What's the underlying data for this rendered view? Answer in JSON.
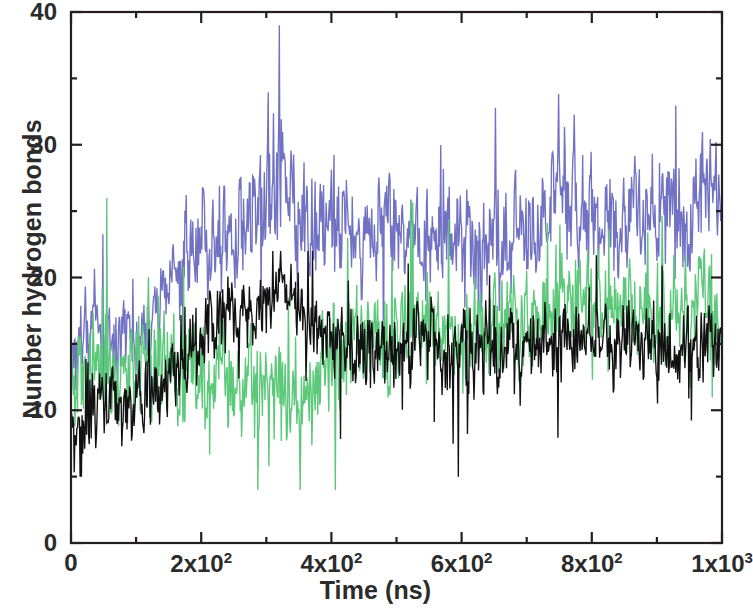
{
  "chart_data": {
    "type": "line",
    "title": "",
    "subtitle": "",
    "xlabel": "Time (ns)",
    "ylabel": "Number hydrogen bonds",
    "xlim": [
      0,
      1000
    ],
    "ylim": [
      0,
      40
    ],
    "grid": false,
    "legend_position": "none",
    "x_major_ticks": [
      0,
      200,
      400,
      600,
      800,
      1000
    ],
    "x_minor_ticks": [
      100,
      300,
      500,
      700,
      900
    ],
    "x_tick_labels": [
      "0",
      "2x10²",
      "4x10²",
      "6x10²",
      "8x10²",
      "1x10³"
    ],
    "x_tick_labels_parts": [
      {
        "mantissa": "0",
        "exp": ""
      },
      {
        "mantissa": "2x10",
        "exp": "2"
      },
      {
        "mantissa": "4x10",
        "exp": "2"
      },
      {
        "mantissa": "6x10",
        "exp": "2"
      },
      {
        "mantissa": "8x10",
        "exp": "2"
      },
      {
        "mantissa": "1x10",
        "exp": "3"
      }
    ],
    "y_major_ticks": [
      0,
      10,
      20,
      30,
      40
    ],
    "y_minor_ticks": [
      5,
      15,
      25,
      35
    ],
    "y_tick_labels": [
      "0",
      "10",
      "20",
      "30",
      "40"
    ],
    "axis_color": "#231f20",
    "background": "#ffffff",
    "sampling_interval_ns": 1,
    "series": [
      {
        "name": "series-blue",
        "color": "#7272c4",
        "draw_order": 1,
        "mean_profile_x": [
          0,
          25,
          50,
          75,
          100,
          125,
          150,
          175,
          200,
          225,
          250,
          275,
          300,
          320,
          340,
          360,
          380,
          400,
          425,
          450,
          475,
          500,
          525,
          550,
          575,
          600,
          625,
          650,
          675,
          700,
          725,
          750,
          775,
          800,
          825,
          850,
          875,
          900,
          925,
          950,
          975,
          1000
        ],
        "mean_profile_y": [
          14.0,
          15.5,
          16.0,
          15.0,
          14.5,
          16.5,
          19.5,
          21.5,
          22.5,
          23.0,
          23.5,
          25.0,
          26.0,
          27.0,
          25.5,
          24.5,
          24.0,
          24.5,
          24.0,
          23.5,
          24.0,
          24.5,
          24.0,
          23.0,
          23.5,
          22.5,
          22.0,
          22.5,
          23.0,
          24.0,
          25.5,
          26.5,
          25.5,
          24.5,
          24.0,
          24.5,
          25.0,
          25.5,
          25.0,
          24.5,
          25.0,
          25.5
        ],
        "band_halfwidth": [
          4.5,
          4.5,
          4.0,
          4.0,
          4.0,
          4.0,
          4.0,
          4.0,
          3.8,
          3.8,
          3.8,
          4.5,
          4.5,
          5.5,
          4.2,
          4.0,
          4.0,
          4.0,
          4.0,
          4.0,
          4.0,
          4.0,
          4.0,
          3.8,
          3.8,
          3.8,
          3.8,
          4.0,
          4.0,
          4.0,
          4.2,
          4.5,
          4.2,
          4.0,
          4.0,
          4.0,
          4.0,
          4.2,
          4.0,
          4.0,
          4.0,
          4.0
        ],
        "observed_min": 7,
        "observed_max": 39,
        "peak_value": 39,
        "peak_time": 320
      },
      {
        "name": "series-green",
        "color": "#5bc87a",
        "draw_order": 2,
        "mean_profile_x": [
          0,
          25,
          50,
          75,
          100,
          125,
          150,
          175,
          200,
          225,
          250,
          275,
          300,
          320,
          340,
          360,
          380,
          400,
          425,
          450,
          475,
          500,
          525,
          550,
          575,
          600,
          625,
          650,
          675,
          700,
          725,
          750,
          775,
          800,
          825,
          850,
          875,
          900,
          925,
          950,
          975,
          1000
        ],
        "mean_profile_y": [
          11.0,
          12.5,
          13.5,
          13.0,
          13.5,
          14.5,
          14.0,
          13.0,
          12.5,
          12.0,
          11.5,
          11.5,
          11.0,
          11.5,
          11.5,
          12.0,
          13.0,
          14.5,
          15.0,
          15.5,
          15.5,
          16.0,
          16.5,
          16.0,
          15.5,
          15.5,
          15.5,
          16.0,
          16.0,
          16.5,
          17.0,
          17.5,
          18.0,
          17.5,
          17.0,
          17.5,
          18.0,
          18.0,
          17.5,
          17.5,
          18.0,
          17.5
        ],
        "band_halfwidth": [
          4.0,
          4.0,
          4.0,
          4.0,
          4.0,
          4.5,
          4.0,
          4.0,
          4.0,
          4.0,
          3.8,
          3.8,
          3.8,
          4.0,
          4.0,
          4.0,
          4.0,
          4.0,
          3.8,
          3.8,
          3.8,
          3.8,
          3.8,
          3.8,
          3.8,
          3.8,
          3.8,
          3.8,
          3.8,
          3.8,
          4.0,
          4.2,
          4.2,
          4.0,
          4.0,
          4.0,
          4.2,
          4.0,
          4.0,
          4.0,
          4.2,
          4.0
        ],
        "observed_min": 4,
        "observed_max": 26,
        "peak_value": 26,
        "peak_time": 55
      },
      {
        "name": "series-black",
        "color": "#111111",
        "draw_order": 3,
        "mean_profile_x": [
          0,
          25,
          50,
          75,
          100,
          125,
          150,
          175,
          200,
          225,
          250,
          275,
          300,
          320,
          340,
          360,
          380,
          400,
          425,
          450,
          475,
          500,
          525,
          550,
          575,
          600,
          625,
          650,
          675,
          700,
          725,
          750,
          775,
          800,
          825,
          850,
          875,
          900,
          925,
          950,
          975,
          1000
        ],
        "mean_profile_y": [
          8.5,
          9.0,
          9.5,
          10.0,
          10.5,
          11.0,
          12.0,
          13.5,
          15.0,
          16.5,
          17.5,
          18.0,
          18.5,
          19.0,
          18.5,
          17.5,
          16.0,
          15.0,
          14.5,
          14.5,
          14.5,
          15.0,
          15.5,
          15.0,
          14.5,
          14.5,
          14.5,
          14.5,
          14.5,
          15.0,
          15.0,
          15.0,
          15.0,
          15.0,
          14.5,
          15.0,
          15.0,
          15.0,
          15.0,
          15.0,
          15.0,
          14.5
        ],
        "band_halfwidth": [
          3.0,
          3.0,
          3.0,
          3.0,
          3.0,
          3.2,
          3.2,
          3.2,
          3.0,
          2.8,
          2.5,
          2.5,
          2.5,
          2.5,
          2.5,
          2.8,
          3.0,
          3.0,
          3.0,
          3.0,
          3.0,
          3.0,
          3.0,
          3.0,
          3.0,
          3.0,
          3.0,
          3.0,
          3.0,
          3.0,
          3.0,
          3.0,
          3.0,
          3.0,
          3.0,
          3.0,
          3.0,
          3.0,
          3.0,
          3.0,
          3.0,
          3.0
        ],
        "observed_min": 5,
        "observed_max": 22,
        "peak_value": 22,
        "peak_time": 310
      }
    ]
  },
  "figure": {
    "plot_left_px": 71,
    "plot_right_px": 722,
    "plot_top_px": 12,
    "plot_bottom_px": 543
  }
}
